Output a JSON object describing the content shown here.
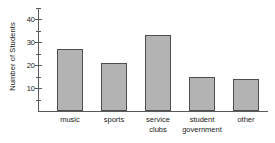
{
  "chart_data": {
    "type": "bar",
    "title": "",
    "subtitle": "",
    "xlabel": "",
    "ylabel": "Number of Students",
    "categories": [
      "music",
      "sports",
      "service clubs",
      "student government",
      "other"
    ],
    "category_lines": [
      [
        "music"
      ],
      [
        "sports"
      ],
      [
        "service",
        "clubs"
      ],
      [
        "student",
        "government"
      ],
      [
        "other"
      ]
    ],
    "values": [
      27,
      21,
      33,
      15,
      14
    ],
    "ylim": [
      0,
      45
    ],
    "y_major_ticks": [
      10,
      20,
      30,
      40
    ],
    "y_major_tick_labels": [
      "10",
      "20",
      "30",
      "40"
    ],
    "y_minor_ticks": [
      5,
      15,
      25,
      35,
      45
    ],
    "grid": false,
    "legend": null,
    "legend_position": "none",
    "bar_color": "#b3b3b3",
    "bar_edge_color": "#4d4d4d",
    "axis_color": "#5a5a5a",
    "text_color": "#1a1a1a",
    "background_color": "#ffffff"
  }
}
